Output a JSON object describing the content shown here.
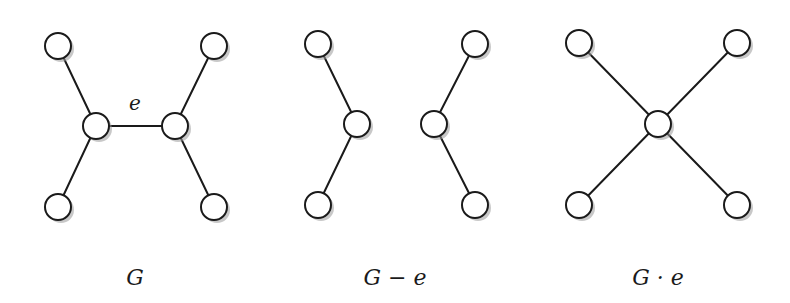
{
  "figure": {
    "graphs": [
      {
        "id": "G",
        "caption": "G",
        "edge_label": "e",
        "nodes": [
          "a",
          "b",
          "u",
          "v",
          "c",
          "d"
        ],
        "edges": [
          [
            "a",
            "u"
          ],
          [
            "b",
            "u"
          ],
          [
            "u",
            "v"
          ],
          [
            "v",
            "c"
          ],
          [
            "v",
            "d"
          ]
        ],
        "labeled_edge": [
          "u",
          "v"
        ]
      },
      {
        "id": "G-minus-e",
        "caption": "G − e",
        "nodes": [
          "a",
          "b",
          "u",
          "v",
          "c",
          "d"
        ],
        "edges": [
          [
            "a",
            "u"
          ],
          [
            "b",
            "u"
          ],
          [
            "v",
            "c"
          ],
          [
            "v",
            "d"
          ]
        ]
      },
      {
        "id": "G-contract-e",
        "caption": "G · e",
        "nodes": [
          "a",
          "b",
          "w",
          "c",
          "d"
        ],
        "edges": [
          [
            "a",
            "w"
          ],
          [
            "b",
            "w"
          ],
          [
            "w",
            "c"
          ],
          [
            "w",
            "d"
          ]
        ]
      }
    ]
  }
}
